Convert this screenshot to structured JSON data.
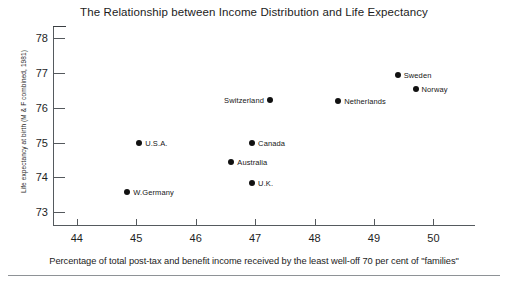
{
  "chart_data": {
    "type": "scatter",
    "title": "The Relationship between Income Distribution and Life Expectancy",
    "xlabel": "Percentage of total post-tax and benefit income received by the least well-off 70 per cent of \"families\"",
    "ylabel": "Life expectancy at birth (M & F combined, 1981)",
    "xlim": [
      43.6,
      50.7
    ],
    "ylim": [
      72.6,
      78.35
    ],
    "xticks": [
      44,
      45,
      46,
      47,
      48,
      49,
      50
    ],
    "xtick_labels": [
      "44",
      "45",
      "46",
      "47",
      "48",
      "49",
      "50"
    ],
    "yticks": [
      73,
      74,
      75,
      76,
      77,
      78
    ],
    "ytick_labels": [
      "73",
      "74",
      "75",
      "76",
      "77",
      "78"
    ],
    "grid": false,
    "legend": null,
    "marker_color": "#111111",
    "axis_color": "#55595d",
    "points": [
      {
        "label": "Sweden",
        "x": 49.4,
        "y": 76.95,
        "label_side": "right"
      },
      {
        "label": "Norway",
        "x": 49.7,
        "y": 76.55,
        "label_side": "right"
      },
      {
        "label": "Netherlands",
        "x": 48.4,
        "y": 76.2,
        "label_side": "right"
      },
      {
        "label": "Switzerland",
        "x": 47.25,
        "y": 76.23,
        "label_side": "left"
      },
      {
        "label": "Canada",
        "x": 46.95,
        "y": 75.0,
        "label_side": "right"
      },
      {
        "label": "U.S.A.",
        "x": 45.05,
        "y": 75.0,
        "label_side": "right"
      },
      {
        "label": "Australia",
        "x": 46.6,
        "y": 74.43,
        "label_side": "right"
      },
      {
        "label": "U.K.",
        "x": 46.95,
        "y": 73.83,
        "label_side": "right"
      },
      {
        "label": "W.Germany",
        "x": 44.85,
        "y": 73.57,
        "label_side": "right"
      }
    ]
  },
  "footer": {
    "source_note": ""
  }
}
